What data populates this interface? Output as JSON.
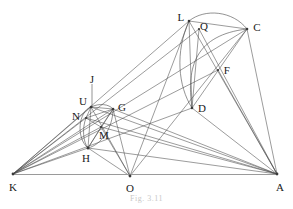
{
  "figure": {
    "caption": "Fig. 3.11",
    "width": 293,
    "height": 209,
    "background": "#ffffff",
    "stroke_color": "#4a4a4a",
    "baseline_color": "#808080",
    "label_color": "#1a1a1a"
  },
  "points": {
    "K": {
      "label": "K",
      "x": 13,
      "y": 174,
      "lx": 13,
      "ly": 187
    },
    "O": {
      "label": "O",
      "x": 130,
      "y": 176,
      "lx": 130,
      "ly": 188
    },
    "A": {
      "label": "A",
      "x": 277,
      "y": 174,
      "lx": 280,
      "ly": 187
    },
    "L": {
      "label": "L",
      "x": 189,
      "y": 21,
      "lx": 181,
      "ly": 17
    },
    "Q": {
      "label": "Q",
      "x": 199,
      "y": 29,
      "lx": 204,
      "ly": 26
    },
    "C": {
      "label": "C",
      "x": 247,
      "y": 29,
      "lx": 257,
      "ly": 27
    },
    "F": {
      "label": "F",
      "x": 218,
      "y": 70,
      "lx": 227,
      "ly": 70
    },
    "D": {
      "label": "D",
      "x": 192,
      "y": 108,
      "lx": 202,
      "ly": 108
    },
    "J": {
      "label": "J",
      "x": 92,
      "y": 108,
      "lx": 92,
      "ly": 79
    },
    "U": {
      "label": "U",
      "x": 91,
      "y": 107,
      "lx": 83,
      "ly": 101
    },
    "G": {
      "label": "G",
      "x": 113,
      "y": 109,
      "lx": 122,
      "ly": 107
    },
    "N": {
      "label": "N",
      "x": 86,
      "y": 118,
      "lx": 76,
      "ly": 116
    },
    "M": {
      "label": "M",
      "x": 101,
      "y": 127,
      "lx": 104,
      "ly": 135
    },
    "H": {
      "label": "H",
      "x": 88,
      "y": 148,
      "lx": 86,
      "ly": 158
    }
  },
  "segments": [
    {
      "name": "baseline-K-A",
      "from": "K",
      "to": "A",
      "kind": "baseline"
    },
    {
      "name": "K-L",
      "from": "K",
      "to": "L",
      "kind": "ray"
    },
    {
      "name": "K-Q",
      "from": "K",
      "to": "Q",
      "kind": "ray"
    },
    {
      "name": "K-C",
      "from": "K",
      "to": "C",
      "kind": "ray"
    },
    {
      "name": "K-F",
      "from": "K",
      "to": "F",
      "kind": "ray"
    },
    {
      "name": "K-D",
      "from": "K",
      "to": "D",
      "kind": "ray"
    },
    {
      "name": "K-U",
      "from": "K",
      "to": "U",
      "kind": "ray"
    },
    {
      "name": "K-G",
      "from": "K",
      "to": "G",
      "kind": "ray"
    },
    {
      "name": "K-N",
      "from": "K",
      "to": "N",
      "kind": "ray"
    },
    {
      "name": "K-M",
      "from": "K",
      "to": "M",
      "kind": "ray"
    },
    {
      "name": "K-H",
      "from": "K",
      "to": "H",
      "kind": "ray"
    },
    {
      "name": "A-L",
      "from": "A",
      "to": "L",
      "kind": "ray"
    },
    {
      "name": "A-Q",
      "from": "A",
      "to": "Q",
      "kind": "ray"
    },
    {
      "name": "A-C",
      "from": "A",
      "to": "C",
      "kind": "ray"
    },
    {
      "name": "A-F",
      "from": "A",
      "to": "F",
      "kind": "ray"
    },
    {
      "name": "A-D",
      "from": "A",
      "to": "D",
      "kind": "ray"
    },
    {
      "name": "A-U",
      "from": "A",
      "to": "U",
      "kind": "ray"
    },
    {
      "name": "A-G",
      "from": "A",
      "to": "G",
      "kind": "ray"
    },
    {
      "name": "A-N",
      "from": "A",
      "to": "N",
      "kind": "ray"
    },
    {
      "name": "A-M",
      "from": "A",
      "to": "M",
      "kind": "ray"
    },
    {
      "name": "A-H",
      "from": "A",
      "to": "H",
      "kind": "ray"
    },
    {
      "name": "O-L",
      "from": "O",
      "to": "L",
      "kind": "ray"
    },
    {
      "name": "O-C",
      "from": "O",
      "to": "C",
      "kind": "ray"
    },
    {
      "name": "O-G",
      "from": "O",
      "to": "G",
      "kind": "ray"
    },
    {
      "name": "O-U",
      "from": "O",
      "to": "U",
      "kind": "ray"
    },
    {
      "name": "O-M",
      "from": "O",
      "to": "M",
      "kind": "ray"
    },
    {
      "name": "O-H",
      "from": "O",
      "to": "H",
      "kind": "ray"
    },
    {
      "name": "L-D",
      "from": "L",
      "to": "D",
      "kind": "chord"
    },
    {
      "name": "L-C",
      "from": "L",
      "to": "C",
      "kind": "chord"
    },
    {
      "name": "Q-D",
      "from": "Q",
      "to": "D",
      "kind": "chord"
    },
    {
      "name": "C-D",
      "from": "C",
      "to": "D",
      "kind": "chord"
    },
    {
      "name": "U-H",
      "from": "U",
      "to": "H",
      "kind": "chord"
    },
    {
      "name": "U-G",
      "from": "U",
      "to": "G",
      "kind": "chord"
    },
    {
      "name": "N-G",
      "from": "N",
      "to": "G",
      "kind": "chord"
    },
    {
      "name": "G-H",
      "from": "G",
      "to": "H",
      "kind": "chord"
    },
    {
      "name": "N-M",
      "from": "N",
      "to": "M",
      "kind": "chord"
    },
    {
      "name": "M-H",
      "from": "M",
      "to": "H",
      "kind": "chord"
    },
    {
      "name": "J-U",
      "from": "J-top",
      "to": "U",
      "kind": "pointer"
    }
  ],
  "arcs": [
    {
      "name": "arc-L-C-outer",
      "from": "L",
      "to": "C"
    },
    {
      "name": "arc-D-Q-C",
      "from": "D",
      "to": "C"
    },
    {
      "name": "arc-L-D",
      "from": "L",
      "to": "D"
    },
    {
      "name": "arc-U-H-left",
      "from": "U",
      "to": "H"
    },
    {
      "name": "arc-U-G-top",
      "from": "U",
      "to": "G"
    },
    {
      "name": "arc-N-H",
      "from": "N",
      "to": "H"
    }
  ]
}
